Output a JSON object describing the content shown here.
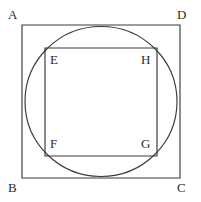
{
  "figure": {
    "canvas": {
      "width": 201,
      "height": 202
    },
    "colors": {
      "background": "#ffffff",
      "stroke": "#3a3a3a",
      "label_text": "#2b2b2b"
    },
    "outer_square": {
      "name": "ABCD",
      "left": 22,
      "top": 25,
      "right": 180,
      "bottom": 178,
      "width": 158,
      "height": 153
    },
    "circle": {
      "center_x": 101,
      "center_y": 101.5,
      "radius_x": 76,
      "radius_y": 75
    },
    "inner_square": {
      "name": "EFGH",
      "left": 45,
      "top": 48,
      "right": 157,
      "bottom": 156,
      "width": 112,
      "height": 108
    },
    "labels": {
      "A": "A",
      "B": "B",
      "C": "C",
      "D": "D",
      "E": "E",
      "F": "F",
      "G": "G",
      "H": "H"
    },
    "label_positions": {
      "A": {
        "left": 8,
        "top": 8
      },
      "D": {
        "left": 177,
        "top": 8
      },
      "B": {
        "left": 8,
        "top": 181
      },
      "C": {
        "left": 177,
        "top": 181
      },
      "E": {
        "left": 50,
        "top": 53
      },
      "H": {
        "left": 141,
        "top": 53
      },
      "F": {
        "left": 50,
        "top": 137
      },
      "G": {
        "left": 141,
        "top": 137
      }
    }
  }
}
